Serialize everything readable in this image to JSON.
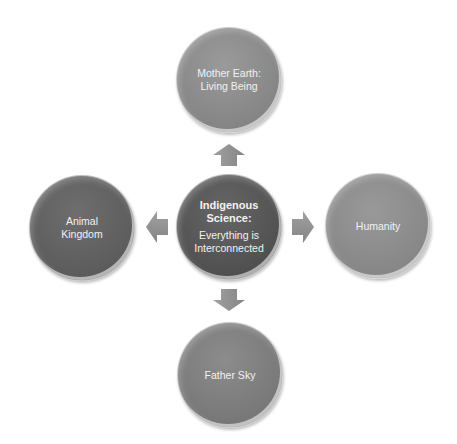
{
  "diagram": {
    "type": "radial",
    "center": {
      "title_lines": [
        "Indigenous",
        "Science:"
      ],
      "body_lines": [
        "Everything is",
        "Interconnected"
      ],
      "color": "#555555"
    },
    "nodes": [
      {
        "id": "top",
        "label_lines": [
          "Mother Earth:",
          "Living Being"
        ],
        "color": "#8c8c8c"
      },
      {
        "id": "left",
        "label_lines": [
          "Animal",
          "Kingdom"
        ],
        "color": "#606060"
      },
      {
        "id": "right",
        "label_lines": [
          "Humanity"
        ],
        "color": "#8a8a8a"
      },
      {
        "id": "bottom",
        "label_lines": [
          "Father Sky"
        ],
        "color": "#7c7c7c"
      }
    ],
    "arrows": [
      {
        "direction": "up",
        "from": "center",
        "to": "top"
      },
      {
        "direction": "left",
        "from": "center",
        "to": "left"
      },
      {
        "direction": "right",
        "from": "center",
        "to": "right"
      },
      {
        "direction": "down",
        "from": "center",
        "to": "bottom"
      }
    ],
    "arrow_color": "#8f8f8f"
  }
}
